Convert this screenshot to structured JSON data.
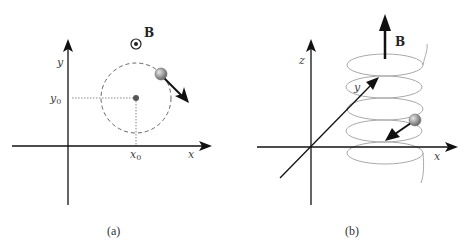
{
  "panels": [
    {
      "id": "a",
      "caption": "(a)",
      "axes": {
        "x_label": "x",
        "y_label": "y"
      },
      "center_labels": {
        "x0": "x",
        "x0_sub": "0",
        "y0": "y",
        "y0_sub": "0"
      },
      "field": {
        "label": "B",
        "symbol": "out-of-page (circled dot)"
      },
      "orbit": "dashed circle",
      "particle": "sphere with velocity arrow"
    },
    {
      "id": "b",
      "caption": "(b)",
      "axes": {
        "x_label": "x",
        "y_label": "y",
        "z_label": "z"
      },
      "field": {
        "label": "B",
        "symbol": "upward arrow"
      },
      "trajectory": "helix",
      "particle": "sphere with velocity arrow"
    }
  ],
  "colors": {
    "axis": "#111111",
    "orbit": "#666666",
    "helix": "#aaaaaa",
    "particle": "#999999"
  }
}
